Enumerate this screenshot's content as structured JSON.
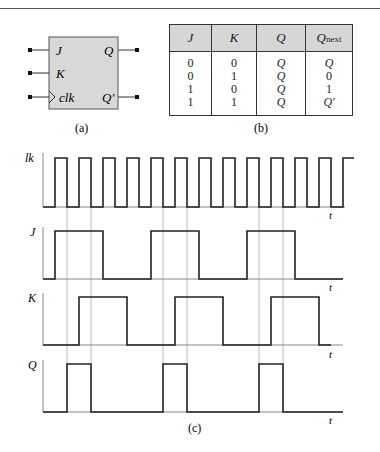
{
  "figure": {
    "flipflop": {
      "inputs": [
        "J",
        "K",
        "clk"
      ],
      "outputs": [
        "Q",
        "Q'"
      ],
      "caption": "(a)"
    },
    "truth_table": {
      "headers": [
        "J",
        "K",
        "Q",
        "Q",
        "next"
      ],
      "rows": [
        {
          "J": "0",
          "K": "0",
          "Q": "Q",
          "Qnext": "Q"
        },
        {
          "J": "0",
          "K": "1",
          "Q": "Q",
          "Qnext": "0"
        },
        {
          "J": "1",
          "K": "0",
          "Q": "Q",
          "Qnext": "1"
        },
        {
          "J": "1",
          "K": "1",
          "Q": "Q",
          "Qnext": "Q'"
        }
      ],
      "caption": "(b)"
    },
    "timing": {
      "signals": [
        {
          "name": "clk",
          "label": "lk"
        },
        {
          "name": "J",
          "label": "J"
        },
        {
          "name": "K",
          "label": "K"
        },
        {
          "name": "Q",
          "label": "Q"
        }
      ],
      "time_label": "t",
      "caption": "(c)"
    }
  }
}
